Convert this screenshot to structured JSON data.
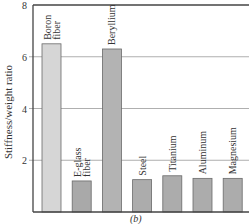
{
  "chart_data": {
    "type": "bar",
    "title": "",
    "xlabel": "",
    "ylabel": "Stiffness/weight ratio",
    "ylim": [
      0,
      8
    ],
    "yticks": [
      2,
      4,
      6,
      8
    ],
    "grid": true,
    "panel_label": "(b)",
    "categories": [
      "Boron fiber",
      "E-glass fiber",
      "Beryllium",
      "Steel",
      "Titanium",
      "Aluminum",
      "Magnesium"
    ],
    "category_lines": [
      [
        "Boron",
        "fiber"
      ],
      [
        "E-glass",
        "fiber"
      ],
      [
        "Beryllium"
      ],
      [
        "Steel"
      ],
      [
        "Titanium"
      ],
      [
        "Aluminum"
      ],
      [
        "Magnesium"
      ]
    ],
    "values": [
      6.5,
      1.2,
      6.3,
      1.25,
      1.4,
      1.3,
      1.3
    ],
    "colors": [
      "#d6d6d6",
      "#a9a9a9",
      "#b3b3b3",
      "#acacac",
      "#acacac",
      "#acacac",
      "#acacac"
    ],
    "legend": null
  }
}
